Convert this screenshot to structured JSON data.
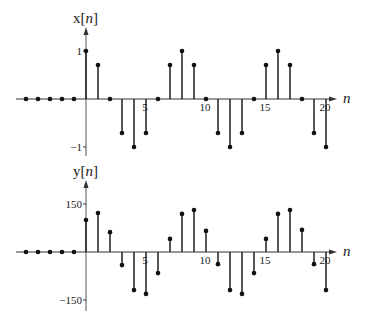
{
  "chart_data": [
    {
      "type": "stem",
      "title": "x[n]",
      "ylabel": "x[n]",
      "xlabel": "n",
      "x": [
        -5,
        -4,
        -3,
        -2,
        -1,
        0,
        1,
        2,
        3,
        4,
        5,
        6,
        7,
        8,
        9,
        10,
        11,
        12,
        13,
        14,
        15,
        16,
        17,
        18,
        19,
        20
      ],
      "values": [
        0,
        0,
        0,
        0,
        0,
        1,
        0.707,
        0,
        -0.707,
        -1,
        -0.707,
        0,
        0.707,
        1,
        0.707,
        0,
        -0.707,
        -1,
        -0.707,
        0,
        0.707,
        1,
        0.707,
        0,
        -0.707,
        -1
      ],
      "xticks": [
        5,
        10,
        15,
        20
      ],
      "xtick_labels": [
        "5",
        "10",
        "15",
        "20"
      ],
      "yticks": [
        1,
        -1
      ],
      "ytick_labels": [
        "1",
        "−1"
      ],
      "ylim": [
        -1.1,
        1.5
      ],
      "xlim": [
        -6,
        21
      ],
      "grid": false,
      "baseline_y": 99,
      "unit_px": 48
    },
    {
      "type": "stem",
      "title": "y[n]",
      "ylabel": "y[n]",
      "xlabel": "n",
      "x": [
        -5,
        -4,
        -3,
        -2,
        -1,
        0,
        1,
        2,
        3,
        4,
        5,
        6,
        7,
        8,
        9,
        10,
        11,
        12,
        13,
        14,
        15,
        16,
        17,
        18,
        19,
        20
      ],
      "values": [
        0,
        0,
        0,
        0,
        0,
        100,
        122,
        62,
        -41,
        -119,
        -131,
        -66,
        41,
        119,
        131,
        66,
        -38,
        -119,
        -131,
        -66,
        41,
        119,
        131,
        69,
        -38,
        -119
      ],
      "xticks": [
        5,
        10,
        15,
        20
      ],
      "xtick_labels": [
        "5",
        "10",
        "15",
        "20"
      ],
      "yticks": [
        150,
        -150
      ],
      "ytick_labels": [
        "150",
        "−150"
      ],
      "ylim": [
        -165,
        210
      ],
      "xlim": [
        -6,
        21
      ],
      "grid": false,
      "baseline_y": 252,
      "unit_px": 0.32
    }
  ],
  "layout": {
    "origin_x": 86,
    "dx": 12,
    "axis_left": 16,
    "axis_right": 337
  }
}
